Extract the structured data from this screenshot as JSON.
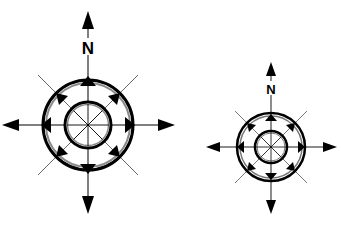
{
  "figure": {
    "colors": {
      "background": "#ffffff",
      "stroke": "#000000",
      "ring_inner_gray": "#8a8a8a",
      "thin_line": "#444444"
    }
  },
  "compasses": [
    {
      "id": "large",
      "north_label": "N",
      "cardinal_arrows": [
        "north",
        "east",
        "south",
        "west"
      ],
      "ring_arrows": [
        "N",
        "NE",
        "E",
        "SE",
        "S",
        "SW",
        "W",
        "NW"
      ]
    },
    {
      "id": "small",
      "north_label": "N",
      "cardinal_arrows": [
        "north",
        "east",
        "south",
        "west"
      ],
      "ring_arrows": [
        "N",
        "NE",
        "E",
        "SE",
        "S",
        "SW",
        "W",
        "NW"
      ]
    }
  ]
}
